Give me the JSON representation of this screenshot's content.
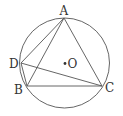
{
  "figure": {
    "points": {
      "A": {
        "label": "A"
      },
      "B": {
        "label": "B"
      },
      "C": {
        "label": "C"
      },
      "D": {
        "label": "D"
      },
      "O": {
        "label": "O"
      }
    },
    "segments": [
      "AB",
      "AC",
      "BC",
      "AD",
      "DC",
      "DB"
    ],
    "circle": "circumcircle of triangle ABC centered at O",
    "line_color": "#555555"
  }
}
